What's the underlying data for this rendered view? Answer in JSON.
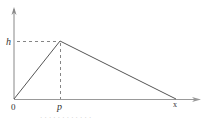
{
  "diagram": {
    "type": "triangular-distribution-graph",
    "colors": {
      "line": "#555555",
      "dashed": "#555555",
      "axis": "#888888",
      "label": "#333333"
    },
    "axes": {
      "origin_label": "0",
      "x_axis_end_label": "x",
      "y_tick_label": "h",
      "x_tick_label": "p"
    },
    "points": {
      "origin": [
        14,
        99
      ],
      "peak": [
        60,
        41
      ],
      "end": [
        176,
        99
      ],
      "y_axis_top": [
        14,
        8
      ],
      "x_axis_right": [
        200,
        99
      ]
    },
    "caption": "· · ·   · · · · · · · · ·"
  }
}
